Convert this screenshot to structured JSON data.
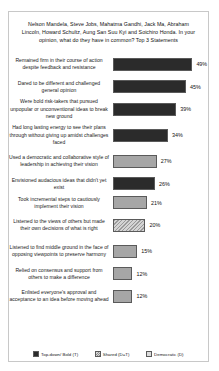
{
  "chart_data": {
    "type": "bar",
    "orientation": "horizontal",
    "title": "Nelson Mandela, Steve Jobs, Mahatma Gandhi, Jack Ma, Abraham Lincoln, Howard Schultz, Aung San Suu Kyi and Soichiro Honda. In your opinion, what do they have in common? Top 3 Statements",
    "xlabel": "",
    "ylabel": "",
    "xlim": [
      0,
      55
    ],
    "grid": false,
    "legend_position": "bottom",
    "value_suffix": "%",
    "legend": [
      {
        "name": "Top-down/ Bold (T)",
        "style": "dark"
      },
      {
        "name": "Shared (D=T)",
        "style": "hatch"
      },
      {
        "name": "Democratic (D)",
        "style": "light"
      }
    ],
    "categories": [
      "Remained firm in their course of action despite feedback and resistance",
      "Dared to be different and challenged general opinion",
      "Were bold risk-takers that pursued unpopular or unconventional ideas to break new ground",
      "Had long lasting energy to see their plans through without giving up amidst challenges faced",
      "Used a democratic and collaborative style of leadership in achieving their vision",
      "Envisioned audacious ideas that didn't yet exist",
      "Took incremental steps to cautiously implement their vision",
      "Listened to the views of others but made their own decisions of what is right",
      "Listened to find middle ground in the face of opposing viewpoints to preserve harmony",
      "Relied on consensus and support from others to make a difference",
      "Enlisted everyone's approval and acceptance to an idea before moving ahead"
    ],
    "values": [
      49,
      45,
      39,
      34,
      27,
      26,
      21,
      20,
      15,
      12,
      12
    ],
    "value_labels": [
      "49%",
      "45%",
      "39%",
      "34%",
      "27%",
      "26%",
      "21%",
      "20%",
      "15%",
      "12%",
      "12%"
    ],
    "series_of_bar": [
      "dark",
      "dark",
      "dark",
      "dark",
      "light",
      "dark",
      "light",
      "hatch",
      "light",
      "light",
      "light"
    ],
    "row_heights": [
      26,
      19,
      26,
      26,
      26,
      19,
      19,
      26,
      26,
      19,
      26
    ],
    "colors": {
      "dark": "#2b2b2b",
      "light": "#a6a6a6",
      "hatch": "#9a9a9a",
      "border": "#c8c8c8"
    }
  }
}
